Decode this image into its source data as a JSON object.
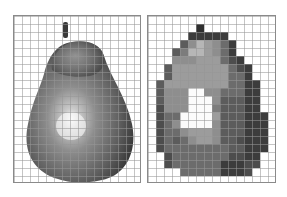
{
  "figure": {
    "left_panel": {
      "label": "pear-photograph",
      "grid": {
        "cols": 16,
        "rows": 21,
        "cell_px": 8
      }
    },
    "right_panel": {
      "label": "pear-pixelated",
      "grid": {
        "cols": 16,
        "rows": 21,
        "cell_px": 8
      },
      "palette": {
        ".": "#ffffff",
        "W": "#fbfbfb",
        "a": "#2f2f2f",
        "b": "#3c3c3c",
        "c": "#4d4d4d",
        "d": "#5c5c5c",
        "e": "#6c6c6c",
        "f": "#7c7c7c",
        "g": "#8e8e8e",
        "h": "#9c9c9c",
        "i": "#b6b6b6"
      },
      "pixels": [
        "................",
        "......a.........",
        ".....bbbbb......",
        "....dgihgeb.....",
        "...dfiihgeb.....",
        "...ggghhhecb....",
        "..dhhhhhhhecb...",
        "..dhhhhhhheeb...",
        ".dhhhhhhhheebb..",
        ".dgggWWggeeebb..",
        ".dgggWWWgdddbb..",
        ".cgggWWWfdddbb..",
        ".ceeWWWWhdddbbb.",
        ".cegWWWWgdddbbb.",
        ".ceeghhhgdddbbb.",
        ".cedeghhgddcbbb.",
        ".ceeeeeeeeddbbb.",
        "..ceeeeeeeccbb..",
        "..ceeeeeebbbcc..",
        "....eeeeebbbc...",
        "................"
      ]
    }
  }
}
